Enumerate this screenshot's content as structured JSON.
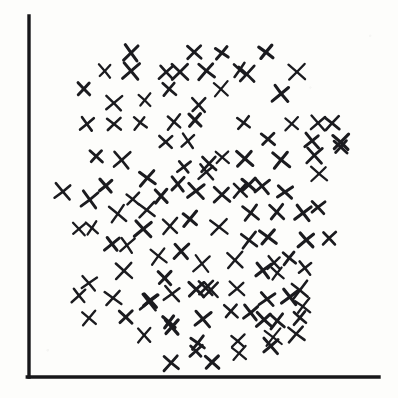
{
  "figure": {
    "kind": "hand-drawn-scatter-plot",
    "width": 398,
    "height": 398,
    "background_color": "#fdfdfb",
    "ink_color": "#1b1b1f",
    "title": "",
    "caption": ""
  },
  "axes": {
    "origin_x": 29,
    "origin_y": 377,
    "y_axis_top": 16,
    "x_axis_right": 379,
    "line_width": 3.4,
    "color": "#17171a",
    "y_label": "",
    "x_label": "",
    "tick_labels_x": [],
    "tick_labels_y": [],
    "grid": false
  },
  "chart_data": {
    "type": "scatter",
    "title": "",
    "xlabel": "",
    "ylabel": "",
    "xlim": [
      0,
      100
    ],
    "ylim": [
      0,
      100
    ],
    "grid": false,
    "legend": null,
    "marker": "x",
    "marker_size_px": 13,
    "marker_stroke_px": 2.6,
    "marker_color": "#1b1b1f",
    "point_count": 142,
    "series": [
      {
        "name": "observations",
        "marker": "x",
        "color": "#1b1b1f",
        "points_px": [
          [
            131,
            53
          ],
          [
            194,
            52
          ],
          [
            222,
            53
          ],
          [
            266,
            52
          ],
          [
            105,
            71
          ],
          [
            131,
            71
          ],
          [
            166,
            72
          ],
          [
            180,
            72
          ],
          [
            206,
            71
          ],
          [
            240,
            70
          ],
          [
            247,
            74
          ],
          [
            297,
            72
          ],
          [
            84,
            89
          ],
          [
            169,
            89
          ],
          [
            221,
            89
          ],
          [
            281,
            94
          ],
          [
            114,
            103
          ],
          [
            145,
            100
          ],
          [
            199,
            105
          ],
          [
            87,
            124
          ],
          [
            114,
            124
          ],
          [
            140,
            123
          ],
          [
            174,
            122
          ],
          [
            195,
            120
          ],
          [
            244,
            123
          ],
          [
            292,
            124
          ],
          [
            318,
            123
          ],
          [
            332,
            123
          ],
          [
            166,
            142
          ],
          [
            188,
            141
          ],
          [
            268,
            139
          ],
          [
            312,
            141
          ],
          [
            341,
            142
          ],
          [
            96,
            156
          ],
          [
            122,
            160
          ],
          [
            184,
            167
          ],
          [
            209,
            164
          ],
          [
            222,
            157
          ],
          [
            245,
            159
          ],
          [
            281,
            160
          ],
          [
            314,
            155
          ],
          [
            341,
            147
          ],
          [
            147,
            178
          ],
          [
            178,
            184
          ],
          [
            206,
            172
          ],
          [
            240,
            190
          ],
          [
            249,
            185
          ],
          [
            262,
            186
          ],
          [
            285,
            192
          ],
          [
            319,
            174
          ]
        ]
      }
    ]
  },
  "points_lower": {
    "points_px": [
      [
        63,
        192
      ],
      [
        106,
        186
      ],
      [
        90,
        200
      ],
      [
        133,
        199
      ],
      [
        161,
        196
      ],
      [
        196,
        191
      ],
      [
        222,
        195
      ],
      [
        118,
        214
      ],
      [
        147,
        210
      ],
      [
        251,
        213
      ],
      [
        277,
        212
      ],
      [
        303,
        213
      ],
      [
        318,
        207
      ],
      [
        79,
        229
      ],
      [
        92,
        228
      ],
      [
        143,
        229
      ],
      [
        170,
        226
      ],
      [
        190,
        219
      ],
      [
        219,
        227
      ],
      [
        249,
        240
      ],
      [
        268,
        237
      ],
      [
        306,
        240
      ],
      [
        329,
        238
      ],
      [
        112,
        244
      ],
      [
        127,
        245
      ],
      [
        158,
        256
      ],
      [
        181,
        251
      ],
      [
        235,
        260
      ],
      [
        274,
        263
      ],
      [
        289,
        258
      ],
      [
        305,
        268
      ],
      [
        89,
        283
      ],
      [
        124,
        271
      ],
      [
        165,
        278
      ],
      [
        202,
        264
      ],
      [
        211,
        290
      ],
      [
        237,
        289
      ],
      [
        263,
        270
      ],
      [
        277,
        273
      ],
      [
        300,
        290
      ],
      [
        79,
        296
      ],
      [
        113,
        298
      ],
      [
        150,
        300
      ],
      [
        172,
        294
      ],
      [
        206,
        288
      ],
      [
        267,
        299
      ],
      [
        290,
        297
      ],
      [
        303,
        306
      ],
      [
        89,
        318
      ],
      [
        126,
        317
      ],
      [
        149,
        302
      ],
      [
        196,
        289
      ],
      [
        231,
        311
      ],
      [
        251,
        313
      ],
      [
        169,
        322
      ],
      [
        203,
        319
      ],
      [
        264,
        320
      ],
      [
        277,
        321
      ],
      [
        300,
        318
      ],
      [
        144,
        335
      ],
      [
        172,
        327
      ],
      [
        198,
        343
      ],
      [
        238,
        341
      ],
      [
        273,
        337
      ],
      [
        196,
        351
      ],
      [
        239,
        353
      ],
      [
        271,
        346
      ],
      [
        296,
        334
      ],
      [
        171,
        363
      ],
      [
        212,
        362
      ]
    ]
  },
  "annotations": {
    "visible_text": []
  }
}
